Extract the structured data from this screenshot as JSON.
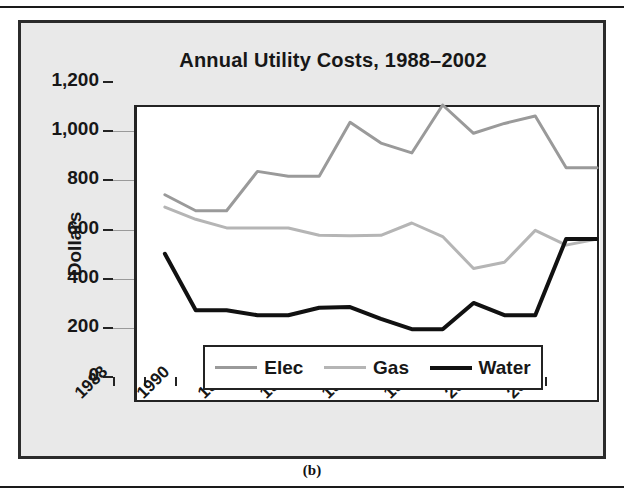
{
  "figure": {
    "caption": "(b)"
  },
  "chart_data": {
    "type": "line",
    "title": "Annual Utility Costs, 1988–2002",
    "xlabel": "",
    "ylabel": "Dollars",
    "ylim": [
      0,
      1200
    ],
    "ytick_labels": [
      "1,200",
      "1,000",
      "800",
      "600",
      "400",
      "200",
      "0"
    ],
    "ytick_values": [
      1200,
      1000,
      800,
      600,
      400,
      200,
      0
    ],
    "xtick_labels": [
      "1988",
      "1990",
      "1992",
      "1994",
      "1996",
      "1998",
      "2000",
      "2002"
    ],
    "xtick_values": [
      1988,
      1990,
      1992,
      1994,
      1996,
      1998,
      2000,
      2002
    ],
    "x_minor_ticks": [
      1988,
      1989,
      1990,
      1991,
      1992,
      1993,
      1994,
      1995,
      1996,
      1997,
      1998,
      1999,
      2000,
      2001,
      2002
    ],
    "xlim": [
      1988,
      2003
    ],
    "grid": "horizontal",
    "legend_position": "lower-center-inside",
    "x": [
      1989,
      1990,
      1991,
      1992,
      1993,
      1994,
      1995,
      1996,
      1997,
      1998,
      1999,
      2000,
      2001,
      2002,
      2003
    ],
    "series": [
      {
        "name": "Elec",
        "color": "#9a9a9a",
        "width": 3,
        "values": [
          835,
          770,
          770,
          930,
          910,
          910,
          1130,
          1045,
          1005,
          1200,
          1085,
          1125,
          1155,
          945,
          945
        ]
      },
      {
        "name": "Gas",
        "color": "#b5b5b5",
        "width": 3,
        "values": [
          785,
          735,
          700,
          700,
          700,
          670,
          668,
          670,
          720,
          665,
          535,
          560,
          690,
          630,
          655
        ]
      },
      {
        "name": "Water",
        "color": "#111111",
        "width": 4,
        "values": [
          595,
          365,
          365,
          345,
          345,
          375,
          378,
          330,
          288,
          288,
          395,
          345,
          345,
          655,
          655
        ]
      }
    ]
  },
  "legend": {
    "items": [
      {
        "label": "Elec",
        "color": "#9a9a9a",
        "width": 3
      },
      {
        "label": "Gas",
        "color": "#b5b5b5",
        "width": 3
      },
      {
        "label": "Water",
        "color": "#111111",
        "width": 4
      }
    ]
  }
}
